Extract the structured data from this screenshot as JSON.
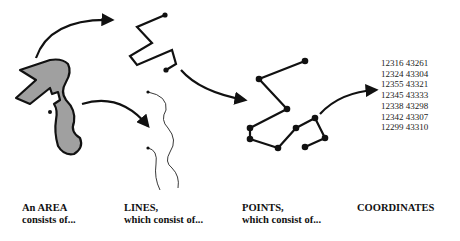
{
  "diagram": {
    "stages": [
      {
        "id": "area",
        "line1": "An AREA",
        "line2": "consists of..."
      },
      {
        "id": "lines",
        "line1": "LINES,",
        "line2": "which consist of..."
      },
      {
        "id": "points",
        "line1": "POINTS,",
        "line2": "which consist of..."
      },
      {
        "id": "coordinates",
        "line1": "COORDINATES",
        "line2": ""
      }
    ],
    "coordinates": [
      "12316 43261",
      "12324 43304",
      "12355 43321",
      "12345 43333",
      "12338 43298",
      "12342 43307",
      "12299 43310"
    ],
    "colors": {
      "area_fill": "#a0a0a0",
      "stroke": "#111111",
      "background": "#ffffff"
    }
  }
}
